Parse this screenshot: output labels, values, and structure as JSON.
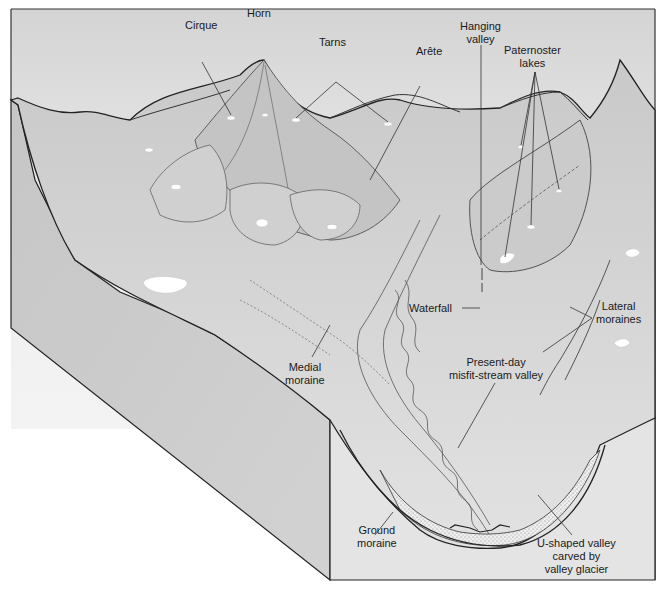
{
  "figure": {
    "colors": {
      "sky_top": "#d9d9d9",
      "sky_bottom": "#f4f4f4",
      "terrain": "#d6d6d6",
      "terrain_light": "#e3e3e3",
      "terrain_dark": "#bdbdbd",
      "side_panel": "#cfcfcf",
      "front_panel": "#e6e6e6",
      "outline": "#222222",
      "lake": "#ffffff",
      "moraine_fill": "#efefef"
    }
  },
  "labels": {
    "horn": {
      "lines": [
        "Horn"
      ]
    },
    "cirque": {
      "lines": [
        "Cirque"
      ]
    },
    "tarns": {
      "lines": [
        "Tarns"
      ]
    },
    "arete": {
      "lines": [
        "Arête"
      ]
    },
    "hanging_valley": {
      "lines": [
        "Hanging",
        "valley"
      ]
    },
    "paternoster_lakes": {
      "lines": [
        "Paternoster",
        "lakes"
      ]
    },
    "waterfall": {
      "lines": [
        "Waterfall"
      ]
    },
    "lateral_moraines": {
      "lines": [
        "Lateral",
        "moraines"
      ]
    },
    "medial_moraine": {
      "lines": [
        "Medial",
        "moraine"
      ]
    },
    "misfit_stream": {
      "lines": [
        "Present-day",
        "misfit-stream valley"
      ]
    },
    "ground_moraine": {
      "lines": [
        "Ground",
        "moraine"
      ]
    },
    "u_shaped_valley": {
      "lines": [
        "U-shaped valley",
        "carved by",
        "valley glacier"
      ]
    }
  }
}
